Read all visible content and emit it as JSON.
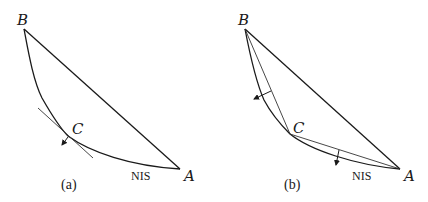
{
  "figure": {
    "panels": [
      {
        "id": "a",
        "caption": "(a)",
        "points": {
          "B": "B",
          "C": "C",
          "A": "A"
        },
        "curve_label": "NIS",
        "elements": [
          "straight line B-A",
          "convex curve B-C-A (NIS)",
          "tangent line at C",
          "arrow at C (normal, outward)"
        ]
      },
      {
        "id": "b",
        "caption": "(b)",
        "points": {
          "B": "B",
          "C": "C",
          "A": "A"
        },
        "curve_label": "NIS",
        "elements": [
          "straight line B-A",
          "convex curve B-C-A (NIS)",
          "chord B-C",
          "chord C-A",
          "normal arrow on chord B-C",
          "normal arrow on chord C-A"
        ]
      }
    ]
  },
  "colors": {
    "stroke": "#1a1a1a",
    "background": "#ffffff"
  }
}
